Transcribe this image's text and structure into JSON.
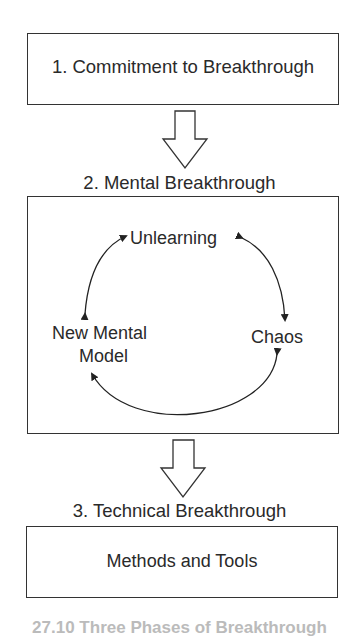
{
  "diagram": {
    "step1": {
      "label": "1. Commitment to Breakthrough"
    },
    "step2": {
      "title": "2. Mental Breakthrough",
      "cycle": {
        "top": "Unlearning",
        "right": "Chaos",
        "left_line1": "New Mental",
        "left_line2": "Model"
      }
    },
    "step3": {
      "title": "3. Technical Breakthrough",
      "label": "Methods and Tools"
    },
    "caption": "27.10 Three Phases of Breakthrough"
  }
}
